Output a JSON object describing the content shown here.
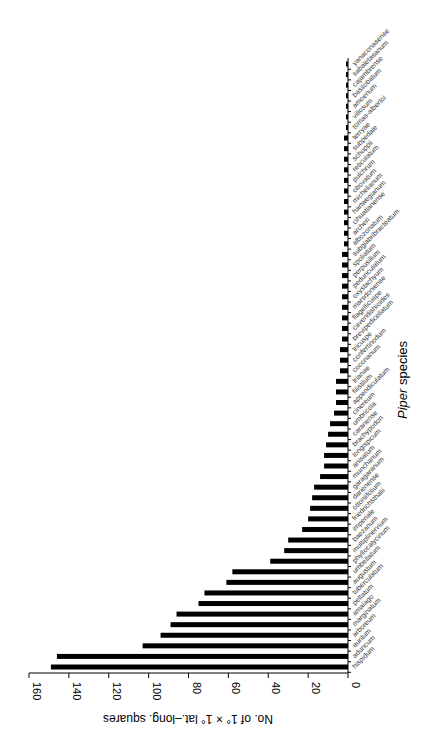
{
  "chart_data": {
    "type": "bar",
    "orientation": "rotated-90-clockwise (horizontal bars growing leftward from axis)",
    "title": "",
    "xlabel": "Piper species",
    "ylabel": "No. of 1° × 1° lat.–long. squares",
    "ylim": [
      0,
      160
    ],
    "yticks": [
      0,
      20,
      40,
      60,
      80,
      100,
      120,
      140,
      160
    ],
    "grid": false,
    "legend": null,
    "categories": [
      "hispidum",
      "aduncum",
      "auritum",
      "arboreum",
      "marginatum",
      "amalago",
      "peltatum",
      "tuberculatum",
      "augustum",
      "umbellatum",
      "phyllocalycinum",
      "multiplinervium",
      "baezanum",
      "imperiale",
      "friedrichsthalii",
      "ottoniifolium",
      "darienense",
      "garagaranum",
      "munchanum",
      "anisatum",
      "longispicum",
      "brachypodon",
      "carariense",
      "umbricola",
      "cinereum",
      "appendiculatum",
      "filistilum",
      "trianae",
      "coconanum",
      "confertinodum",
      "tricuspe",
      "brevipedicellatum",
      "cavendishioides",
      "flagellicuspe",
      "marsdoniense",
      "oxystachyum",
      "pedunculatum",
      "perpusillum",
      "spoliatum",
      "subglabribracteatum",
      "albozonatum",
      "archeri",
      "cihuatlanense",
      "hartwegianum",
      "michelianum",
      "obovatum",
      "pulchrum",
      "reticulatum",
      "schuppii",
      "subpedale",
      "terryae",
      "tomas-albertoi",
      "villosum",
      "amoenum",
      "basilobatum",
      "cajambrense",
      "sabaletasanum",
      "yanaconasense"
    ],
    "values": [
      149,
      146,
      103,
      94,
      89,
      86,
      75,
      72,
      61,
      58,
      39,
      32,
      30,
      23,
      20,
      19,
      18,
      17,
      14,
      12,
      12,
      11,
      10,
      9,
      7,
      6,
      6,
      6,
      4,
      4,
      4,
      3,
      3,
      3,
      3,
      3,
      3,
      3,
      3,
      3,
      2,
      2,
      2,
      2,
      2,
      2,
      2,
      2,
      2,
      2,
      2,
      1,
      1,
      1,
      1,
      1,
      1,
      1
    ],
    "bar_color": "#000000"
  }
}
